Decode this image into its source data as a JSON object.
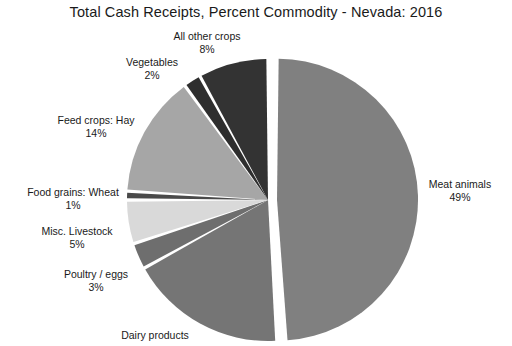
{
  "chart_data": {
    "type": "pie",
    "title": "Total Cash Receipts, Percent Commodity - Nevada: 2016",
    "xlabel": "",
    "ylabel": "",
    "legend_position": "none",
    "labels_shown": "outside-callout",
    "units": "percent",
    "categories": [
      "Meat animals",
      "Dairy products",
      "Poultry / eggs",
      "Misc. Livestock",
      "Food grains:  Wheat",
      "Feed crops:  Hay",
      "Vegetables",
      "All other crops"
    ],
    "values": [
      49,
      18,
      3,
      5,
      1,
      14,
      2,
      8
    ],
    "colors": [
      "#808080",
      "#757575",
      "#6e6e6e",
      "#d9d9d9",
      "#4a4a4a",
      "#a6a6a6",
      "#2e2e2e",
      "#333333"
    ],
    "slices": [
      {
        "name": "Meat animals",
        "value": 49,
        "percent_label": "49%",
        "color": "#808080",
        "exploded": true
      },
      {
        "name": "Dairy products",
        "value": 18,
        "percent_label": "",
        "color": "#757575",
        "exploded": false
      },
      {
        "name": "Poultry / eggs",
        "value": 3,
        "percent_label": "3%",
        "color": "#6e6e6e",
        "exploded": false
      },
      {
        "name": "Misc. Livestock",
        "value": 5,
        "percent_label": "5%",
        "color": "#d9d9d9",
        "exploded": false
      },
      {
        "name": "Food grains:  Wheat",
        "value": 1,
        "percent_label": "1%",
        "color": "#4a4a4a",
        "exploded": false
      },
      {
        "name": "Feed crops:  Hay",
        "value": 14,
        "percent_label": "14%",
        "color": "#a6a6a6",
        "exploded": false
      },
      {
        "name": "Vegetables",
        "value": 2,
        "percent_label": "2%",
        "color": "#2e2e2e",
        "exploded": false
      },
      {
        "name": "All other crops",
        "value": 8,
        "percent_label": "8%",
        "color": "#333333",
        "exploded": false
      }
    ]
  },
  "labels": {
    "all_other_crops": {
      "name": "All other crops",
      "pct": "8%"
    },
    "vegetables": {
      "name": "Vegetables",
      "pct": "2%"
    },
    "hay": {
      "name": "Feed crops:  Hay",
      "pct": "14%"
    },
    "wheat": {
      "name": "Food grains:  Wheat",
      "pct": "1%"
    },
    "misc_livestock": {
      "name": "Misc. Livestock",
      "pct": "5%"
    },
    "poultry_eggs": {
      "name": "Poultry / eggs",
      "pct": "3%"
    },
    "dairy_products": {
      "name": "Dairy products",
      "pct": ""
    },
    "meat_animals": {
      "name": "Meat animals",
      "pct": "49%"
    }
  },
  "style": {
    "background": "#ffffff",
    "text_color": "#1a1a1a",
    "slice_gap_color": "#ffffff"
  }
}
